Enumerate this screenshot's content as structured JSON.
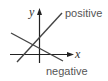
{
  "diagram": {
    "axes": {
      "x_label": "x",
      "y_label": "y",
      "color": "#222222"
    },
    "lines": [
      {
        "name": "positive",
        "label": "positive",
        "slope_sign": "positive",
        "color": "#444444"
      },
      {
        "name": "negative",
        "label": "negative",
        "slope_sign": "negative",
        "color": "#444444"
      }
    ]
  }
}
